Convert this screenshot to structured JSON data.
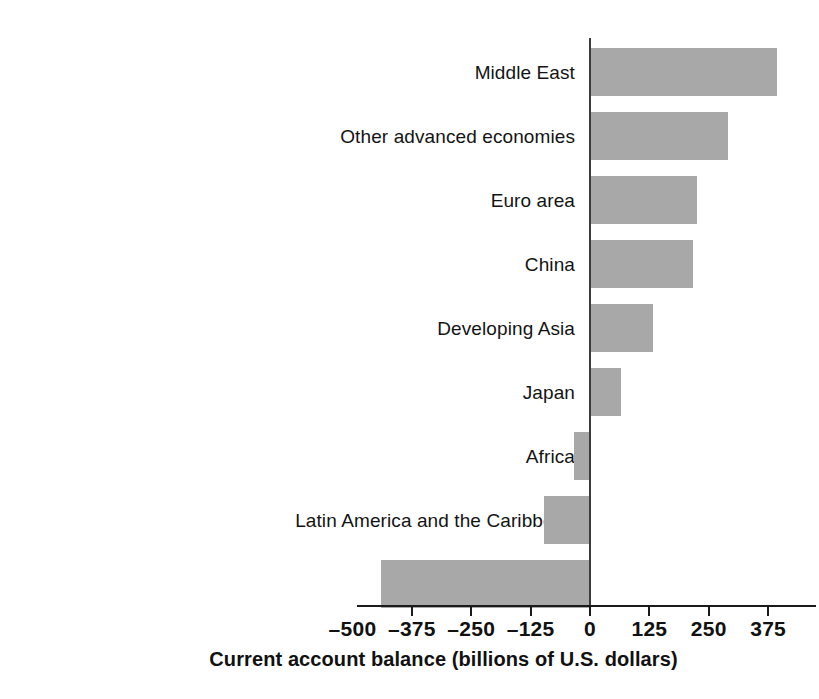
{
  "chart_data": {
    "type": "bar",
    "orientation": "horizontal",
    "title": "",
    "xlabel": "Current account balance (billions of U.S. dollars)",
    "ylabel": "",
    "categories": [
      "Middle East",
      "Other advanced economies",
      "Euro area",
      "China",
      "Developing Asia",
      "Japan",
      "Africa",
      "Latin America and the Caribbean",
      "United States"
    ],
    "values": [
      394,
      290,
      225,
      217,
      133,
      65,
      -34,
      -97,
      -440
    ],
    "xlim": [
      -500,
      437
    ],
    "xticks": [
      -500,
      -375,
      -250,
      -125,
      0,
      125,
      250,
      375
    ],
    "xticklabels": [
      "–500",
      "–375",
      "–250",
      "–125",
      "0",
      "125",
      "250",
      "375"
    ],
    "grid": false,
    "legend": null,
    "bar_color": "#a8a8a8",
    "axis_color": "#1a1a1a",
    "zero_line_color": "#3b3b3b"
  }
}
